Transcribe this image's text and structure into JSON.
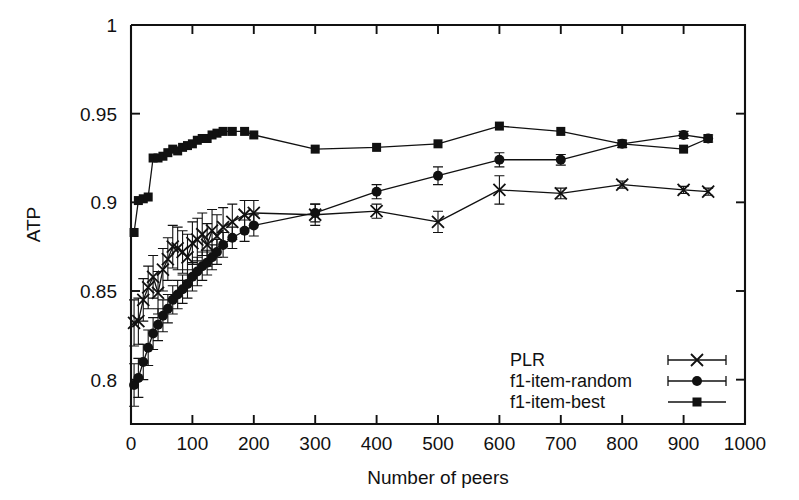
{
  "chart_data": {
    "type": "line",
    "title": "",
    "xlabel": "Number of peers",
    "ylabel": "ATP",
    "xlim": [
      0,
      1000
    ],
    "ylim": [
      0.775,
      1.0
    ],
    "xticks": [
      0,
      100,
      200,
      300,
      400,
      500,
      600,
      700,
      800,
      900,
      1000
    ],
    "xtick_labels": [
      "0",
      "100",
      "200",
      "300",
      "400",
      "500",
      "600",
      "700",
      "800",
      "900",
      "1000"
    ],
    "yticks": [
      0.8,
      0.85,
      0.9,
      0.95,
      1.0
    ],
    "ytick_labels": [
      "0.8",
      "0.85",
      "0.9",
      "0.95",
      "1"
    ],
    "grid": false,
    "legend_position": "bottom-right",
    "error_bars": true,
    "series": [
      {
        "name": "PLR",
        "marker": "x",
        "x": [
          5,
          12,
          20,
          28,
          36,
          44,
          52,
          60,
          68,
          76,
          84,
          92,
          100,
          108,
          116,
          124,
          132,
          140,
          150,
          165,
          185,
          200,
          300,
          400,
          500,
          600,
          700,
          800,
          900,
          940
        ],
        "values": [
          0.832,
          0.833,
          0.845,
          0.852,
          0.858,
          0.849,
          0.862,
          0.868,
          0.875,
          0.874,
          0.872,
          0.869,
          0.877,
          0.879,
          0.882,
          0.876,
          0.884,
          0.881,
          0.886,
          0.889,
          0.893,
          0.894,
          0.893,
          0.895,
          0.889,
          0.907,
          0.905,
          0.91,
          0.907,
          0.906
        ],
        "yerr": [
          0.013,
          0.013,
          0.012,
          0.012,
          0.012,
          0.012,
          0.012,
          0.012,
          0.012,
          0.012,
          0.012,
          0.013,
          0.012,
          0.012,
          0.012,
          0.012,
          0.012,
          0.012,
          0.011,
          0.01,
          0.008,
          0.007,
          0.006,
          0.004,
          0.006,
          0.008,
          0.003,
          0.002,
          0.002,
          0.002
        ]
      },
      {
        "name": "f1-item-random",
        "marker": "circle",
        "x": [
          5,
          12,
          20,
          28,
          36,
          44,
          52,
          60,
          68,
          76,
          84,
          92,
          100,
          108,
          116,
          124,
          132,
          140,
          150,
          165,
          185,
          200,
          300,
          400,
          500,
          600,
          700,
          800,
          900,
          940
        ],
        "values": [
          0.797,
          0.801,
          0.81,
          0.818,
          0.826,
          0.831,
          0.836,
          0.84,
          0.845,
          0.848,
          0.851,
          0.854,
          0.858,
          0.861,
          0.864,
          0.866,
          0.869,
          0.872,
          0.876,
          0.88,
          0.884,
          0.887,
          0.894,
          0.906,
          0.915,
          0.924,
          0.924,
          0.933,
          0.938,
          0.936
        ],
        "yerr": [
          0.012,
          0.011,
          0.01,
          0.01,
          0.009,
          0.009,
          0.009,
          0.008,
          0.008,
          0.008,
          0.008,
          0.008,
          0.008,
          0.008,
          0.008,
          0.007,
          0.007,
          0.007,
          0.007,
          0.006,
          0.006,
          0.006,
          0.005,
          0.004,
          0.005,
          0.004,
          0.003,
          0.002,
          0.002,
          0.002
        ]
      },
      {
        "name": "f1-item-best",
        "marker": "square",
        "x": [
          5,
          12,
          20,
          28,
          36,
          44,
          52,
          60,
          68,
          76,
          84,
          92,
          100,
          108,
          116,
          124,
          132,
          140,
          150,
          165,
          185,
          200,
          300,
          400,
          500,
          600,
          700,
          800,
          900,
          940
        ],
        "values": [
          0.883,
          0.901,
          0.902,
          0.903,
          0.925,
          0.925,
          0.926,
          0.928,
          0.93,
          0.929,
          0.931,
          0.932,
          0.933,
          0.935,
          0.936,
          0.936,
          0.938,
          0.939,
          0.94,
          0.94,
          0.94,
          0.938,
          0.93,
          0.931,
          0.933,
          0.943,
          0.94,
          0.933,
          0.93,
          0.936
        ],
        "yerr": [
          0.0,
          0.0,
          0.0,
          0.0,
          0.0,
          0.0,
          0.0,
          0.0,
          0.0,
          0.0,
          0.0,
          0.0,
          0.0,
          0.0,
          0.0,
          0.0,
          0.0,
          0.0,
          0.0,
          0.0,
          0.0,
          0.0,
          0.0,
          0.0,
          0.0,
          0.0,
          0.0,
          0.0,
          0.0,
          0.0
        ]
      }
    ]
  },
  "legend": {
    "entries": [
      {
        "label": "PLR",
        "marker": "x"
      },
      {
        "label": "f1-item-random",
        "marker": "circle"
      },
      {
        "label": "f1-item-best",
        "marker": "square"
      }
    ]
  },
  "colors": {
    "ink": "#111111",
    "background": "#ffffff"
  }
}
